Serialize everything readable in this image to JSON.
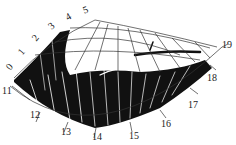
{
  "diagram": {
    "type": "polar sector grid with dense black streak traces",
    "colors": {
      "ink": "#111111",
      "grid": "#333333",
      "background": "#ffffff"
    },
    "left_edge_labels": [
      "0",
      "1",
      "2",
      "3",
      "4",
      "5"
    ],
    "outer_arc_labels": [
      "11",
      "12",
      "13",
      "14",
      "15",
      "16",
      "17",
      "18",
      "19"
    ]
  }
}
